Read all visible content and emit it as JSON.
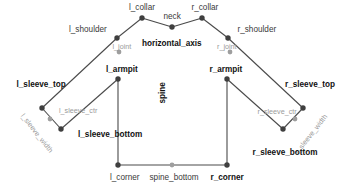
{
  "diagram": {
    "background_color": "#ffffff",
    "edge_color": "#4a4a4a",
    "node_color_primary": "#3f3f3f",
    "node_color_secondary": "#9e9e9e",
    "width": 352,
    "height": 189
  },
  "nodes": [
    {
      "id": "l_collar",
      "label": "l_collar",
      "x": 142,
      "y": 18,
      "kind": "primary"
    },
    {
      "id": "neck",
      "label": "neck",
      "x": 172,
      "y": 27,
      "kind": "primary"
    },
    {
      "id": "r_collar",
      "label": "r_collar",
      "x": 202,
      "y": 18,
      "kind": "primary"
    },
    {
      "id": "l_shoulder",
      "label": "l_shoulder",
      "x": 117,
      "y": 38,
      "kind": "primary"
    },
    {
      "id": "r_shoulder",
      "label": "r_shoulder",
      "x": 228,
      "y": 38,
      "kind": "primary"
    },
    {
      "id": "l_joint",
      "label": "l_joint",
      "x": 119,
      "y": 52,
      "kind": "secondary"
    },
    {
      "id": "r_joint",
      "label": "r_joint",
      "x": 230,
      "y": 52,
      "kind": "secondary"
    },
    {
      "id": "l_armpit",
      "label": "l_armpit",
      "x": 118,
      "y": 79,
      "kind": "primary"
    },
    {
      "id": "r_armpit",
      "label": "r_armpit",
      "x": 227,
      "y": 79,
      "kind": "primary"
    },
    {
      "id": "l_sleeve_top",
      "label": "l_sleeve_top",
      "x": 42,
      "y": 108,
      "kind": "primary"
    },
    {
      "id": "l_sleeve_ctr",
      "label": "l_sleeve_ctr",
      "x": 50,
      "y": 119,
      "kind": "secondary"
    },
    {
      "id": "l_sleeve_bottom",
      "label": "l_sleeve_bottom",
      "x": 61,
      "y": 129,
      "kind": "primary"
    },
    {
      "id": "r_sleeve_top",
      "label": "r_sleeve_top",
      "x": 303,
      "y": 108,
      "kind": "primary"
    },
    {
      "id": "r_sleeve_ctr",
      "label": "r_sleeve_ctr",
      "x": 295,
      "y": 119,
      "kind": "secondary"
    },
    {
      "id": "r_sleeve_bottom",
      "label": "r_sleeve_bottom",
      "x": 283,
      "y": 129,
      "kind": "primary"
    },
    {
      "id": "l_corner",
      "label": "l_corner",
      "x": 118,
      "y": 165,
      "kind": "primary"
    },
    {
      "id": "spine_bottom",
      "label": "spine_bottom",
      "x": 172,
      "y": 165,
      "kind": "secondary"
    },
    {
      "id": "r_corner",
      "label": "r_corner",
      "x": 227,
      "y": 165,
      "kind": "primary"
    }
  ],
  "edges": [
    {
      "from": "l_collar",
      "to": "neck"
    },
    {
      "from": "neck",
      "to": "r_collar"
    },
    {
      "from": "l_collar",
      "to": "l_shoulder"
    },
    {
      "from": "r_collar",
      "to": "r_shoulder"
    },
    {
      "from": "l_shoulder",
      "to": "l_sleeve_top"
    },
    {
      "from": "r_shoulder",
      "to": "r_sleeve_top"
    },
    {
      "from": "l_sleeve_top",
      "to": "l_sleeve_bottom"
    },
    {
      "from": "r_sleeve_top",
      "to": "r_sleeve_bottom"
    },
    {
      "from": "l_sleeve_bottom",
      "to": "l_armpit"
    },
    {
      "from": "r_sleeve_bottom",
      "to": "r_armpit"
    },
    {
      "from": "l_armpit",
      "to": "l_corner"
    },
    {
      "from": "r_armpit",
      "to": "r_corner"
    },
    {
      "from": "l_corner",
      "to": "spine_bottom"
    },
    {
      "from": "spine_bottom",
      "to": "r_corner"
    }
  ],
  "labels": [
    {
      "id": "l_collar",
      "text": "l_collar",
      "x": 142,
      "y": 8,
      "style": "dark",
      "anchor": "center",
      "rotation": 0
    },
    {
      "id": "neck",
      "text": "neck",
      "x": 172,
      "y": 17,
      "style": "dark",
      "anchor": "center",
      "rotation": 0
    },
    {
      "id": "r_collar",
      "text": "r_collar",
      "x": 205,
      "y": 8,
      "style": "dark",
      "anchor": "center",
      "rotation": 0
    },
    {
      "id": "l_shoulder",
      "text": "l_shoulder",
      "x": 88,
      "y": 30,
      "style": "dark",
      "anchor": "center",
      "rotation": 0
    },
    {
      "id": "r_shoulder",
      "text": "r_shoulder",
      "x": 257,
      "y": 30,
      "style": "dark",
      "anchor": "center",
      "rotation": 0
    },
    {
      "id": "l_joint",
      "text": "l_joint",
      "x": 122,
      "y": 46,
      "style": "light",
      "anchor": "center",
      "rotation": 0
    },
    {
      "id": "r_joint",
      "text": "r_joint",
      "x": 227,
      "y": 46,
      "style": "light",
      "anchor": "center",
      "rotation": 0
    },
    {
      "id": "horizontal_axis",
      "text": "horizontal_axis",
      "x": 172,
      "y": 44,
      "style": "bold",
      "anchor": "center",
      "rotation": 0
    },
    {
      "id": "l_armpit",
      "text": "l_armpit",
      "x": 122,
      "y": 70,
      "style": "bold",
      "anchor": "center",
      "rotation": 0
    },
    {
      "id": "r_armpit",
      "text": "r_armpit",
      "x": 226,
      "y": 70,
      "style": "bold",
      "anchor": "center",
      "rotation": 0
    },
    {
      "id": "spine",
      "text": "spine",
      "x": 163,
      "y": 93,
      "style": "bold",
      "anchor": "center",
      "rotation": -90
    },
    {
      "id": "l_sleeve_top",
      "text": "l_sleeve_top",
      "x": 41,
      "y": 85,
      "style": "bold",
      "anchor": "center",
      "rotation": 0
    },
    {
      "id": "r_sleeve_top",
      "text": "r_sleeve_top",
      "x": 310,
      "y": 85,
      "style": "bold",
      "anchor": "center",
      "rotation": 0
    },
    {
      "id": "l_sleeve_ctr",
      "text": "l_sleeve_ctr",
      "x": 78,
      "y": 110,
      "style": "light",
      "anchor": "center",
      "rotation": 0
    },
    {
      "id": "r_sleeve_ctr",
      "text": "r_sleeve_ctr",
      "x": 277,
      "y": 111,
      "style": "light",
      "anchor": "center",
      "rotation": 0
    },
    {
      "id": "l_sleeve_width",
      "text": "l_sleeve_width",
      "x": 37,
      "y": 133,
      "style": "light",
      "anchor": "center",
      "rotation": 52
    },
    {
      "id": "r_sleeve_width",
      "text": "r_sleeve_width",
      "x": 311,
      "y": 134,
      "style": "light",
      "anchor": "center",
      "rotation": -52
    },
    {
      "id": "l_sleeve_bottom",
      "text": "l_sleeve_bottom",
      "x": 110,
      "y": 135,
      "style": "bold",
      "anchor": "center",
      "rotation": 0
    },
    {
      "id": "r_sleeve_bottom",
      "text": "r_sleeve_bottom",
      "x": 285,
      "y": 153,
      "style": "bold",
      "anchor": "center",
      "rotation": 0
    },
    {
      "id": "l_corner",
      "text": "l_corner",
      "x": 125,
      "y": 178,
      "style": "dark",
      "anchor": "center",
      "rotation": 0
    },
    {
      "id": "spine_bottom",
      "text": "spine_bottom",
      "x": 174,
      "y": 178,
      "style": "dark",
      "anchor": "center",
      "rotation": 0
    },
    {
      "id": "r_corner",
      "text": "r_corner",
      "x": 227,
      "y": 178,
      "style": "bold",
      "anchor": "center",
      "rotation": 0
    }
  ]
}
